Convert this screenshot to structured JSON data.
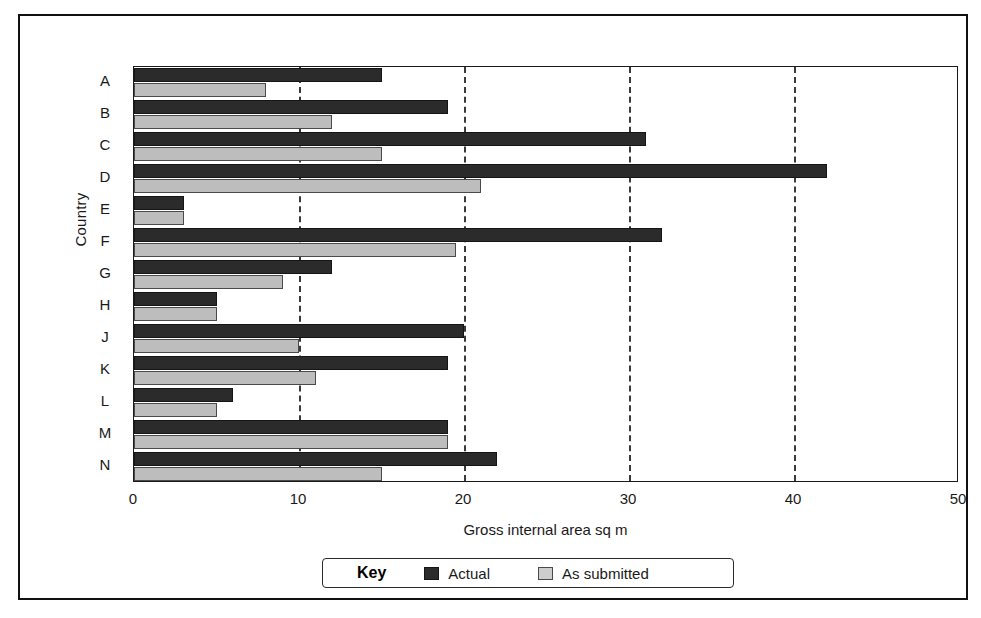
{
  "figure": {
    "y_axis_title": "Country",
    "legend_key_label": "Key"
  },
  "chart_data": {
    "type": "bar",
    "orientation": "horizontal",
    "title": "",
    "xlabel": "Gross internal area sq m",
    "ylabel": "Country",
    "xlim": [
      0,
      50
    ],
    "xticks": [
      0,
      10,
      20,
      30,
      40,
      50
    ],
    "xtick_labels": [
      "0",
      "10",
      "20",
      "30",
      "40",
      "50"
    ],
    "gridlines": [
      10,
      20,
      30,
      40
    ],
    "grid": true,
    "grid_style": "dashed-vertical",
    "legend_position": "below-axis",
    "categories": [
      "A",
      "B",
      "C",
      "D",
      "E",
      "F",
      "G",
      "H",
      "J",
      "K",
      "L",
      "M",
      "N"
    ],
    "series": [
      {
        "name": "Actual",
        "color": "#2b2b2b",
        "values": [
          15,
          19,
          31,
          42,
          3,
          32,
          12,
          5,
          20,
          19,
          6,
          19,
          22
        ]
      },
      {
        "name": "As submitted",
        "color": "#bdbdbd",
        "values": [
          8,
          12,
          15,
          21,
          3,
          19.5,
          9,
          5,
          10,
          11,
          5,
          19,
          15
        ]
      }
    ]
  }
}
